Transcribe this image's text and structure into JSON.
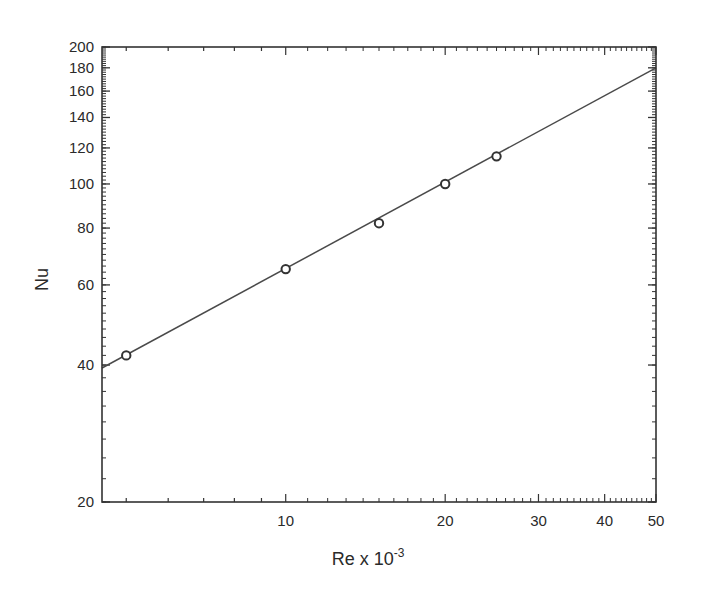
{
  "chart_data": {
    "type": "scatter",
    "title": "",
    "xlabel": "Re x 10",
    "xlabel_superscript": "-3",
    "ylabel": "Nu",
    "x_scale": "log",
    "y_scale": "log",
    "xlim": [
      4.5,
      50
    ],
    "ylim": [
      20,
      200
    ],
    "grid": false,
    "legend": null,
    "x_ticks": [
      10,
      20,
      30,
      40,
      50
    ],
    "x_tick_labels": [
      "10",
      "20",
      "30",
      "40",
      "50"
    ],
    "y_ticks": [
      20,
      40,
      60,
      80,
      100,
      120,
      140,
      160,
      180,
      200
    ],
    "y_tick_labels": [
      "20",
      "40",
      "60",
      "80",
      "100",
      "120",
      "140",
      "160",
      "180",
      "200"
    ],
    "series": [
      {
        "name": "Experimental data",
        "type": "scatter",
        "marker": "open-circle",
        "x": [
          5,
          10,
          15,
          20,
          25
        ],
        "y": [
          42,
          65,
          82,
          100,
          115
        ]
      },
      {
        "name": "Fit line",
        "type": "line",
        "x": [
          4.5,
          50
        ],
        "y": [
          39.4,
          180
        ]
      }
    ]
  },
  "colors": {
    "axis": "#333333",
    "line": "#4a4a4a",
    "marker": "#333333",
    "text": "#2a2a2a",
    "background": "#ffffff"
  }
}
